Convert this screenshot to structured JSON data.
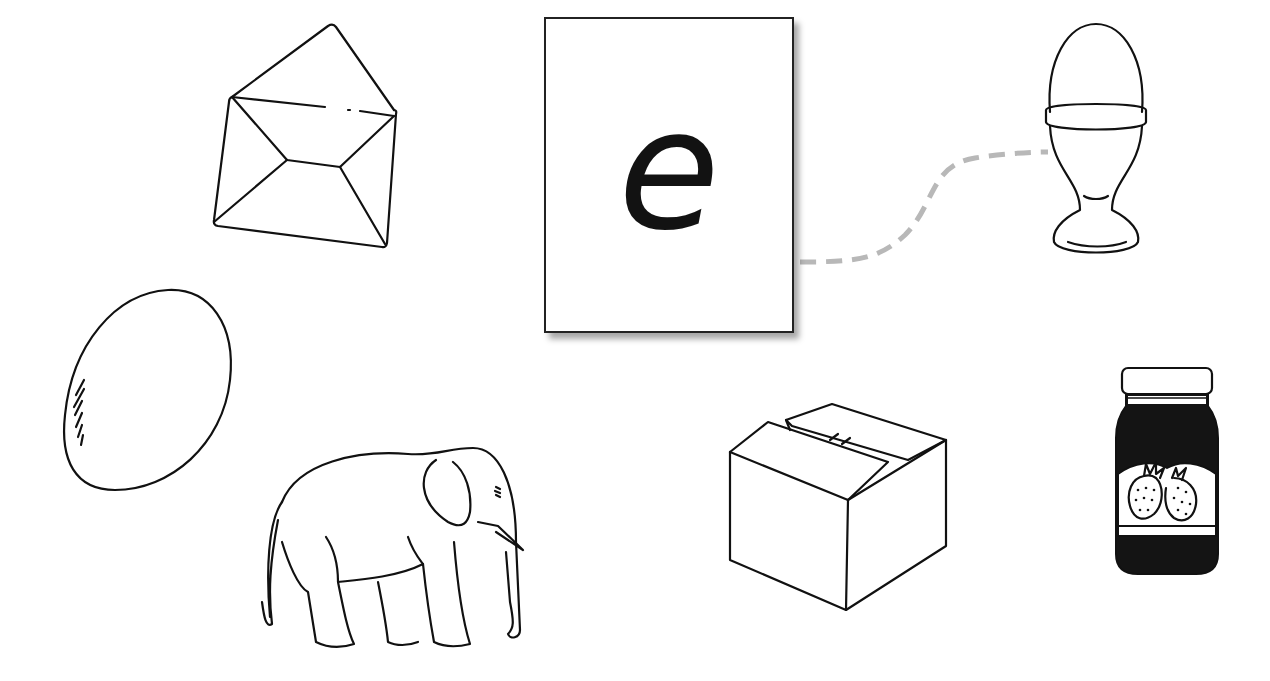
{
  "activity": {
    "card": {
      "letter": "e"
    },
    "pictures": [
      {
        "id": "envelope",
        "label": "envelope",
        "position": "top-left"
      },
      {
        "id": "egg",
        "label": "egg",
        "position": "middle-left"
      },
      {
        "id": "elephant",
        "label": "elephant",
        "position": "bottom-left"
      },
      {
        "id": "box",
        "label": "box",
        "position": "bottom-center"
      },
      {
        "id": "egg-cup",
        "label": "egg in egg cup",
        "position": "top-right"
      },
      {
        "id": "jam-jar",
        "label": "strawberry jam jar",
        "position": "bottom-right"
      }
    ],
    "connection": {
      "from": "card",
      "to": "egg-cup",
      "style": "dashed",
      "color": "#b5b5b5"
    }
  },
  "colors": {
    "background": "#ffffff",
    "ink": "#111111",
    "connector": "#b5b5b5"
  }
}
